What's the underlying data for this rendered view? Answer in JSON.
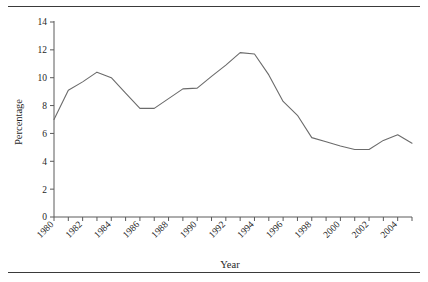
{
  "figure": {
    "top_rule": "horizontal-rule",
    "bottom_rule": "horizontal-rule"
  },
  "chart_data": {
    "type": "line",
    "title": "",
    "xlabel": "Year",
    "ylabel": "Percentage",
    "xlim": [
      1980,
      2005
    ],
    "ylim": [
      0,
      14
    ],
    "grid": false,
    "legend": "none",
    "y_ticks": [
      0,
      2,
      4,
      6,
      8,
      10,
      12,
      14
    ],
    "y_tick_labels": [
      "0",
      "2",
      "4",
      "6",
      "8",
      "10",
      "12",
      "14"
    ],
    "x_ticks": [
      1980,
      1982,
      1984,
      1986,
      1988,
      1990,
      1992,
      1994,
      1996,
      1998,
      2000,
      2002,
      2004
    ],
    "x_tick_labels": [
      "1980",
      "1982",
      "1984",
      "1986",
      "1988",
      "1990",
      "1992",
      "1994",
      "1996",
      "1998",
      "2000",
      "2002",
      "2004"
    ],
    "x_minor_ticks": [
      1981,
      1983,
      1985,
      1987,
      1989,
      1991,
      1993,
      1995,
      1997,
      1999,
      2001,
      2003,
      2005
    ],
    "x": [
      1980,
      1981,
      1982,
      1983,
      1984,
      1985,
      1986,
      1987,
      1988,
      1989,
      1990,
      1991,
      1992,
      1993,
      1994,
      1995,
      1996,
      1997,
      1998,
      1999,
      2000,
      2001,
      2002,
      2003,
      2004,
      2005
    ],
    "values": [
      7.0,
      9.1,
      9.7,
      10.4,
      10.0,
      8.9,
      7.8,
      7.8,
      8.5,
      9.2,
      9.25,
      10.1,
      10.9,
      11.8,
      11.7,
      10.2,
      8.3,
      7.3,
      5.7,
      5.4,
      5.1,
      4.85,
      4.85,
      5.5,
      5.9,
      5.3
    ],
    "series_name": "Percentage",
    "line_color": "#6b6b6b"
  }
}
